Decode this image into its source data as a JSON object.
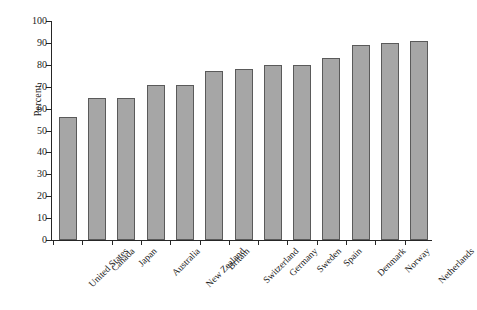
{
  "chart_data": {
    "type": "bar",
    "title": "",
    "xlabel": "",
    "ylabel": "Percent",
    "ylim": [
      0,
      100
    ],
    "yticks": [
      0,
      10,
      20,
      30,
      40,
      50,
      60,
      70,
      80,
      90,
      100
    ],
    "grid": false,
    "legend": false,
    "bar_color": "#a6a6a6",
    "bar_edge_color": "#5a5a5a",
    "axis_color": "#262626",
    "background": "#ffffff",
    "categories": [
      "United States",
      "Canada",
      "Japan",
      "Australia",
      "New Zealand",
      "Britain",
      "Switzerland",
      "Germany",
      "Sweden",
      "Spain",
      "Denmark",
      "Norway",
      "Netherlands"
    ],
    "values": [
      56,
      65,
      65,
      71,
      71,
      77,
      78,
      80,
      80,
      83,
      89,
      90,
      91
    ]
  }
}
